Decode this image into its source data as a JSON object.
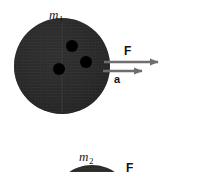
{
  "figure": {
    "background_color": "#ffffff",
    "width": 200,
    "height": 172,
    "body_fill": "#2b2b2b",
    "dot_fill": "#000000",
    "arrow_color": "#6e6e6e",
    "text_color": "#111111"
  },
  "top_panel": {
    "mass_label": "m",
    "mass_subscript": "1",
    "force_label": "F",
    "acceleration_label": "a",
    "disk": {
      "center_x": 62,
      "center_y": 66,
      "radius": 48
    },
    "interior_dots": [
      {
        "cx": 72,
        "cy": 46,
        "r": 6
      },
      {
        "cx": 59,
        "cy": 69,
        "r": 6
      },
      {
        "cx": 86,
        "cy": 62,
        "r": 6
      }
    ],
    "force_arrow": {
      "x1": 107,
      "y1": 62,
      "x2": 164,
      "y2": 62
    },
    "acceleration_arrow": {
      "x1": 105,
      "y1": 71,
      "x2": 148,
      "y2": 71
    }
  },
  "bottom_panel": {
    "mass_label": "m",
    "mass_subscript": "2",
    "force_label": "F",
    "disk": {
      "center_x": 92,
      "center_y": 205,
      "radius": 40
    },
    "note": "partially cropped by bottom edge of frame"
  }
}
